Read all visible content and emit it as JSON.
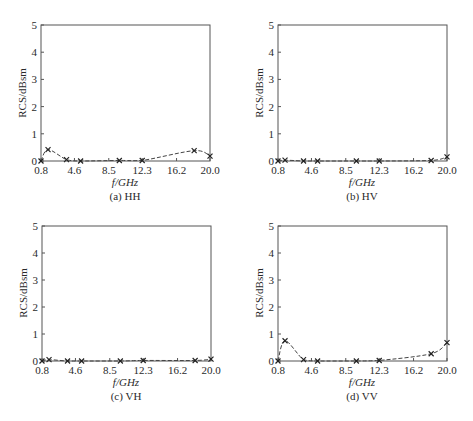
{
  "figure": {
    "panels_layout": "2x2",
    "chart_data": [
      {
        "type": "line",
        "panel": "a",
        "title": "(a) HH",
        "xlabel": "f/GHz",
        "ylabel": "RCS/dBsm",
        "xticks": [
          "0.8",
          "4.6",
          "8.5",
          "12.3",
          "16.2",
          "20.0"
        ],
        "yticks": [
          "0",
          "1",
          "2",
          "3",
          "4",
          "5"
        ],
        "xlim": [
          0.8,
          20.0
        ],
        "ylim": [
          0,
          5
        ],
        "grid": false,
        "line_style": "dashed",
        "marker": "x",
        "x": [
          0.8,
          1.6,
          3.7,
          5.3,
          9.7,
          12.3,
          18.2,
          20.0
        ],
        "values": [
          0.0,
          0.42,
          0.05,
          0.0,
          0.02,
          0.02,
          0.38,
          0.18
        ]
      },
      {
        "type": "line",
        "panel": "b",
        "title": "(b) HV",
        "xlabel": "f/GHz",
        "ylabel": "RCS/dBsm",
        "xticks": [
          "0.8",
          "4.6",
          "8.5",
          "12.3",
          "16.2",
          "20.0"
        ],
        "yticks": [
          "0",
          "1",
          "2",
          "3",
          "4",
          "5"
        ],
        "xlim": [
          0.8,
          20.0
        ],
        "ylim": [
          0,
          5
        ],
        "grid": false,
        "line_style": "dashed",
        "marker": "x",
        "x": [
          0.8,
          1.6,
          3.7,
          5.3,
          9.7,
          12.3,
          18.2,
          20.0
        ],
        "values": [
          0.0,
          0.03,
          0.0,
          0.0,
          0.0,
          0.0,
          0.02,
          0.15
        ]
      },
      {
        "type": "line",
        "panel": "c",
        "title": "(c) VH",
        "xlabel": "f/GHz",
        "ylabel": "RCS/dBsm",
        "xticks": [
          "0.8",
          "4.6",
          "8.5",
          "12.3",
          "16.2",
          "20.0"
        ],
        "yticks": [
          "0",
          "1",
          "2",
          "3",
          "4",
          "5"
        ],
        "xlim": [
          0.8,
          20.0
        ],
        "ylim": [
          0,
          5
        ],
        "grid": false,
        "line_style": "dashed",
        "marker": "x",
        "x": [
          0.8,
          1.6,
          3.7,
          5.3,
          9.7,
          12.3,
          18.2,
          20.0
        ],
        "values": [
          0.0,
          0.05,
          0.0,
          0.0,
          0.0,
          0.02,
          0.02,
          0.07
        ]
      },
      {
        "type": "line",
        "panel": "d",
        "title": "(d) VV",
        "xlabel": "f/GHz",
        "ylabel": "RCS/dBsm",
        "xticks": [
          "0.8",
          "4.6",
          "8.5",
          "12.3",
          "16.2",
          "20.0"
        ],
        "yticks": [
          "0",
          "1",
          "2",
          "3",
          "4",
          "5"
        ],
        "xlim": [
          0.8,
          20.0
        ],
        "ylim": [
          0,
          5
        ],
        "grid": false,
        "line_style": "dashed",
        "marker": "x",
        "x": [
          0.8,
          1.6,
          3.7,
          5.3,
          9.7,
          12.3,
          18.2,
          20.0
        ],
        "values": [
          0.0,
          0.75,
          0.05,
          0.0,
          0.0,
          0.02,
          0.27,
          0.68
        ]
      }
    ]
  },
  "chart_data": [
    {
      "type": "line",
      "title": "(a) HH",
      "xlabel": "f/GHz",
      "ylabel": "RCS/dBsm",
      "x": [
        0.8,
        1.6,
        3.7,
        5.3,
        9.7,
        12.3,
        18.2,
        20.0
      ],
      "values": [
        0.0,
        0.42,
        0.05,
        0.0,
        0.02,
        0.02,
        0.38,
        0.18
      ],
      "xticks": [
        "0.8",
        "4.6",
        "8.5",
        "12.3",
        "16.2",
        "20.0"
      ],
      "yticks": [
        "0",
        "1",
        "2",
        "3",
        "4",
        "5"
      ],
      "xlim": [
        0.8,
        20.0
      ],
      "ylim": [
        0,
        5
      ],
      "grid": false
    },
    {
      "type": "line",
      "title": "(b) HV",
      "xlabel": "f/GHz",
      "ylabel": "RCS/dBsm",
      "x": [
        0.8,
        1.6,
        3.7,
        5.3,
        9.7,
        12.3,
        18.2,
        20.0
      ],
      "values": [
        0.0,
        0.03,
        0.0,
        0.0,
        0.0,
        0.0,
        0.02,
        0.15
      ],
      "xticks": [
        "0.8",
        "4.6",
        "8.5",
        "12.3",
        "16.2",
        "20.0"
      ],
      "yticks": [
        "0",
        "1",
        "2",
        "3",
        "4",
        "5"
      ],
      "xlim": [
        0.8,
        20.0
      ],
      "ylim": [
        0,
        5
      ],
      "grid": false
    },
    {
      "type": "line",
      "title": "(c) VH",
      "xlabel": "f/GHz",
      "ylabel": "RCS/dBsm",
      "x": [
        0.8,
        1.6,
        3.7,
        5.3,
        9.7,
        12.3,
        18.2,
        20.0
      ],
      "values": [
        0.0,
        0.05,
        0.0,
        0.0,
        0.0,
        0.02,
        0.02,
        0.07
      ],
      "xticks": [
        "0.8",
        "4.6",
        "8.5",
        "12.3",
        "16.2",
        "20.0"
      ],
      "yticks": [
        "0",
        "1",
        "2",
        "3",
        "4",
        "5"
      ],
      "xlim": [
        0.8,
        20.0
      ],
      "ylim": [
        0,
        5
      ],
      "grid": false
    },
    {
      "type": "line",
      "title": "(d) VV",
      "xlabel": "f/GHz",
      "ylabel": "RCS/dBsm",
      "x": [
        0.8,
        1.6,
        3.7,
        5.3,
        9.7,
        12.3,
        18.2,
        20.0
      ],
      "values": [
        0.0,
        0.75,
        0.05,
        0.0,
        0.0,
        0.02,
        0.27,
        0.68
      ],
      "xticks": [
        "0.8",
        "4.6",
        "8.5",
        "12.3",
        "16.2",
        "20.0"
      ],
      "yticks": [
        "0",
        "1",
        "2",
        "3",
        "4",
        "5"
      ],
      "xlim": [
        0.8,
        20.0
      ],
      "ylim": [
        0,
        5
      ],
      "grid": false
    }
  ],
  "style": {
    "axis_color": "#555555",
    "line_color": "#444444",
    "text_color": "#2a2a2a"
  }
}
